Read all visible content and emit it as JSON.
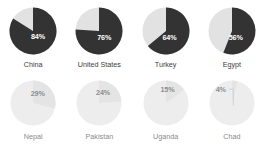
{
  "chart_data": {
    "type": "pie",
    "title": "",
    "subtitle": "",
    "xlabel": "",
    "ylabel": "",
    "legend": [],
    "grid": false,
    "layout": {
      "rows": 2,
      "columns": 4,
      "arrangement": "4x2 small-multiples grid"
    },
    "colors": {
      "background": "#ffffff",
      "top_row_value_slice": "#333333",
      "top_row_remainder_slice": "#e2e2e2",
      "top_row_value_label": "#ffffff",
      "top_row_country_label": "#3d3d3d",
      "bottom_row_value_slice": "#e4e4e4",
      "bottom_row_remainder_slice": "#ededed",
      "bottom_row_value_label": "#8d8d8d",
      "bottom_row_country_label": "#8a8a8a",
      "leader_line": "#c9c9c9"
    },
    "note": "Top row rendered in full contrast; bottom row rendered faded / low contrast.",
    "categories": [
      "China",
      "United States",
      "Turkey",
      "Egypt",
      "Nepal",
      "Pakistan",
      "Uganda",
      "Chad"
    ],
    "values": [
      84,
      76,
      64,
      56,
      29,
      24,
      15,
      4
    ],
    "units": "%",
    "series": [
      {
        "name": "Share",
        "values": [
          84,
          76,
          64,
          56,
          29,
          24,
          15,
          4
        ]
      }
    ],
    "slices": [
      {
        "category": "China",
        "value": 84,
        "label": "84%",
        "remainder": 16,
        "row": "top",
        "emphasis": "full",
        "leader_line": false
      },
      {
        "category": "United States",
        "value": 76,
        "label": "76%",
        "remainder": 24,
        "row": "top",
        "emphasis": "full",
        "leader_line": false
      },
      {
        "category": "Turkey",
        "value": 64,
        "label": "64%",
        "remainder": 36,
        "row": "top",
        "emphasis": "full",
        "leader_line": false
      },
      {
        "category": "Egypt",
        "value": 56,
        "label": "56%",
        "remainder": 44,
        "row": "top",
        "emphasis": "full",
        "leader_line": false
      },
      {
        "category": "Nepal",
        "value": 29,
        "label": "29%",
        "remainder": 71,
        "row": "bottom",
        "emphasis": "faded",
        "leader_line": false
      },
      {
        "category": "Pakistan",
        "value": 24,
        "label": "24%",
        "remainder": 76,
        "row": "bottom",
        "emphasis": "faded",
        "leader_line": false
      },
      {
        "category": "Uganda",
        "value": 15,
        "label": "15%",
        "remainder": 85,
        "row": "bottom",
        "emphasis": "faded",
        "leader_line": false
      },
      {
        "category": "Chad",
        "value": 4,
        "label": "4%",
        "remainder": 96,
        "row": "bottom",
        "emphasis": "faded",
        "leader_line": true
      }
    ]
  },
  "charts": [
    {
      "country": "China",
      "percent_label": "84%"
    },
    {
      "country": "United States",
      "percent_label": "76%"
    },
    {
      "country": "Turkey",
      "percent_label": "64%"
    },
    {
      "country": "Egypt",
      "percent_label": "56%"
    },
    {
      "country": "Nepal",
      "percent_label": "29%"
    },
    {
      "country": "Pakistan",
      "percent_label": "24%"
    },
    {
      "country": "Uganda",
      "percent_label": "15%"
    },
    {
      "country": "Chad",
      "percent_label": "4%"
    }
  ]
}
